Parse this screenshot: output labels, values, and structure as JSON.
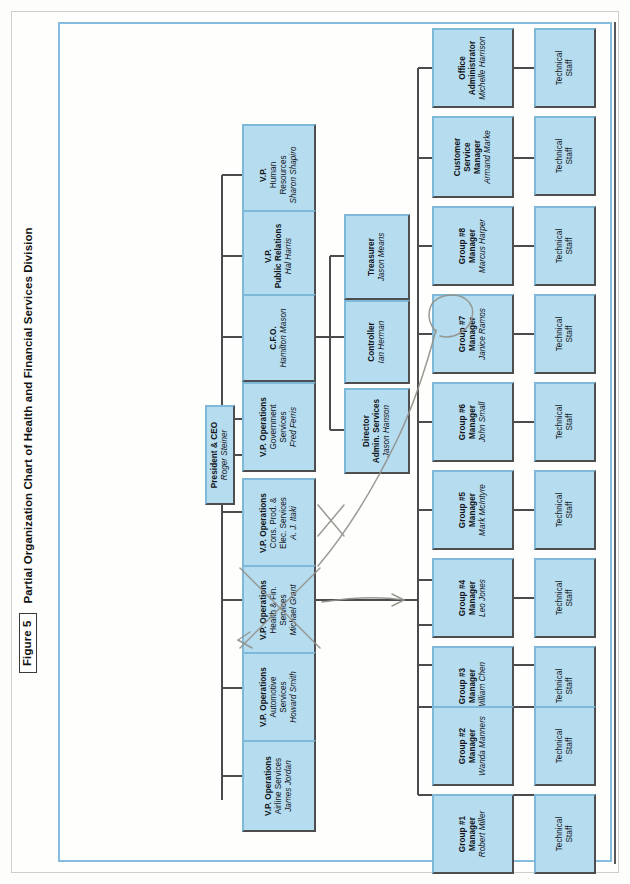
{
  "figure": {
    "number_label": "Figure 5",
    "title": "Partial Organization Chart of Health and Financial Services Division"
  },
  "colors": {
    "node_fill": "#b6dcf0",
    "node_fill_pale": "#c7e4f4",
    "node_border_light": "#7fb9da",
    "node_border_dark": "#4e4e50",
    "frame_border": "#86bcdd",
    "annotation_pencil": "#8d8d86"
  },
  "chart_data": {
    "type": "diagram",
    "title": "Partial Organization Chart of Health and Financial Services Division",
    "orientation": "rotated-90-ccw",
    "nodes": [
      {
        "id": "ceo",
        "title": "President & CEO",
        "sub": "",
        "name": "Roger Steiner",
        "level": 0
      },
      {
        "id": "exec-asst",
        "title": "Executive",
        "sub": "Assistant",
        "name": "Paula Sprague",
        "level": 1
      },
      {
        "id": "vp-hr",
        "title": "V.P.",
        "sub": "Human\nResources",
        "name": "Sharon Shapiro",
        "level": 2
      },
      {
        "id": "vp-pr",
        "title": "V.P.",
        "sub": "Public Relations",
        "name": "Hal Harris",
        "level": 2
      },
      {
        "id": "cfo",
        "title": "C.F.O.",
        "sub": "",
        "name": "Hamilton Mason",
        "level": 2
      },
      {
        "id": "vp-gov",
        "title": "V.P. Operations",
        "sub": "Government\nServices",
        "name": "Fred Ferris",
        "level": 2
      },
      {
        "id": "vp-cons",
        "title": "V.P. Operations",
        "sub": "Cons. Prod. &\nElec. Services",
        "name": "A. J. Itaki",
        "level": 2
      },
      {
        "id": "vp-health",
        "title": "V.P. Operations",
        "sub": "Health & Fin.\nServices",
        "name": "Michael Grant",
        "level": 2
      },
      {
        "id": "vp-auto",
        "title": "V.P. Operations",
        "sub": "Automotive\nServices",
        "name": "Howard Smith",
        "level": 2
      },
      {
        "id": "vp-airline",
        "title": "V.P. Operations",
        "sub": "Airline Services",
        "name": "James Jordan",
        "level": 2
      },
      {
        "id": "treasurer",
        "title": "Treasurer",
        "sub": "",
        "name": "Jason Means",
        "level": 3
      },
      {
        "id": "controller",
        "title": "Controller",
        "sub": "",
        "name": "Ian Herman",
        "level": 3
      },
      {
        "id": "dir-admin",
        "title": "Director",
        "sub": "Admin. Services",
        "name": "Jason Hanson",
        "level": 3
      },
      {
        "id": "office-admin",
        "title": "Office",
        "sub": "Administrator",
        "name": "Michelle Harrison",
        "level": 4
      },
      {
        "id": "cust-svc",
        "title": "Customer",
        "sub": "Service\nManager",
        "name": "Armand Marke",
        "level": 4
      },
      {
        "id": "group8",
        "title": "Group #8",
        "sub": "Manager",
        "name": "Marcus Harper",
        "level": 4
      },
      {
        "id": "group7",
        "title": "Group #7",
        "sub": "Manager",
        "name": "Janice Ramos",
        "level": 4
      },
      {
        "id": "group6",
        "title": "Group #6",
        "sub": "Manager",
        "name": "John Small",
        "level": 4
      },
      {
        "id": "group5",
        "title": "Group #5",
        "sub": "Manager",
        "name": "Mark McIntyre",
        "level": 4
      },
      {
        "id": "group4",
        "title": "Group #4",
        "sub": "Manager",
        "name": "Leo Jones",
        "level": 4
      },
      {
        "id": "group3",
        "title": "Group #3",
        "sub": "Manager",
        "name": "William Chen",
        "level": 4
      },
      {
        "id": "group2",
        "title": "Group #2",
        "sub": "Manager",
        "name": "Wanda Manners",
        "level": 4
      },
      {
        "id": "group1",
        "title": "Group #1",
        "sub": "Manager",
        "name": "Robert Miller",
        "level": 4
      }
    ],
    "staff_label": {
      "line1": "Technical",
      "line2": "Staff"
    },
    "staff_count": 10,
    "annotations": [
      {
        "kind": "pencil-x",
        "over": "vp-cons",
        "note": "hand-drawn X crossing the box"
      },
      {
        "kind": "pencil-x",
        "over": "vp-health",
        "note": "hand-drawn X crossing the box"
      },
      {
        "kind": "pencil-arrow",
        "from": "vp-health",
        "to": "group7",
        "note": "curved pencil arrow"
      },
      {
        "kind": "pencil-circle",
        "over": "group7",
        "note": "hand-drawn loop around Group #7 Manager"
      },
      {
        "kind": "pencil-arrow",
        "from": "vp-health",
        "to": "right",
        "note": "short horizontal pencil arrow"
      }
    ]
  }
}
